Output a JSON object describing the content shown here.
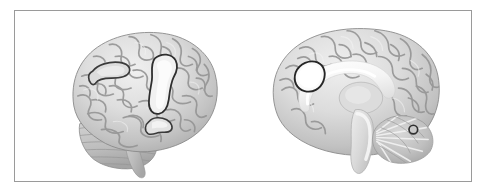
{
  "figure": {
    "type": "brain-surface-rendering",
    "modality": "grayscale 3D cortical surface render",
    "frame_color": "#9a9a9a",
    "background_color": "#ffffff",
    "panel_count": 2,
    "panels": [
      {
        "id": "lateral",
        "view_label": "lateral",
        "hemisphere_orientation": "anterior to the left, posterior to the right",
        "clusters": [
          {
            "id": "cluster-superior-frontal",
            "shape": "elongated horizontal outline",
            "fill": "#d9d9d9",
            "outline": "#3a3a3a",
            "region": "superior frontal / precentral"
          },
          {
            "id": "cluster-precentral-vertical",
            "shape": "vertically elongated bright blob",
            "fill": "#f2f2f2",
            "outline": "#2e2e2e",
            "region": "precentral / postcentral"
          },
          {
            "id": "cluster-supramarginal",
            "shape": "small irregular outline",
            "fill": "#e4e4e4",
            "outline": "#3a3a3a",
            "region": "supramarginal / superior temporal"
          }
        ]
      },
      {
        "id": "medial",
        "view_label": "medial",
        "hemisphere_orientation": "anterior to the left, posterior to the right",
        "landmarks": [
          "corpus callosum",
          "thalamus",
          "brainstem",
          "cerebellum"
        ],
        "clusters": [
          {
            "id": "cluster-anterior-cingulate",
            "shape": "oval bean",
            "fill": "#fafafa",
            "outline": "#262626",
            "region": "anterior cingulate / medial superior frontal"
          },
          {
            "id": "cluster-cerebellar-dot",
            "shape": "small ring",
            "fill": "#c9c9c9",
            "outline": "#303030",
            "region": "posterior cerebellum"
          }
        ]
      }
    ],
    "palette": {
      "cortex_light": "#e8e8e8",
      "cortex_mid": "#c4c4c4",
      "sulcus_dark": "#8e8e8e",
      "highlight": "#fbfbfb",
      "outline": "#2e2e2e"
    }
  }
}
